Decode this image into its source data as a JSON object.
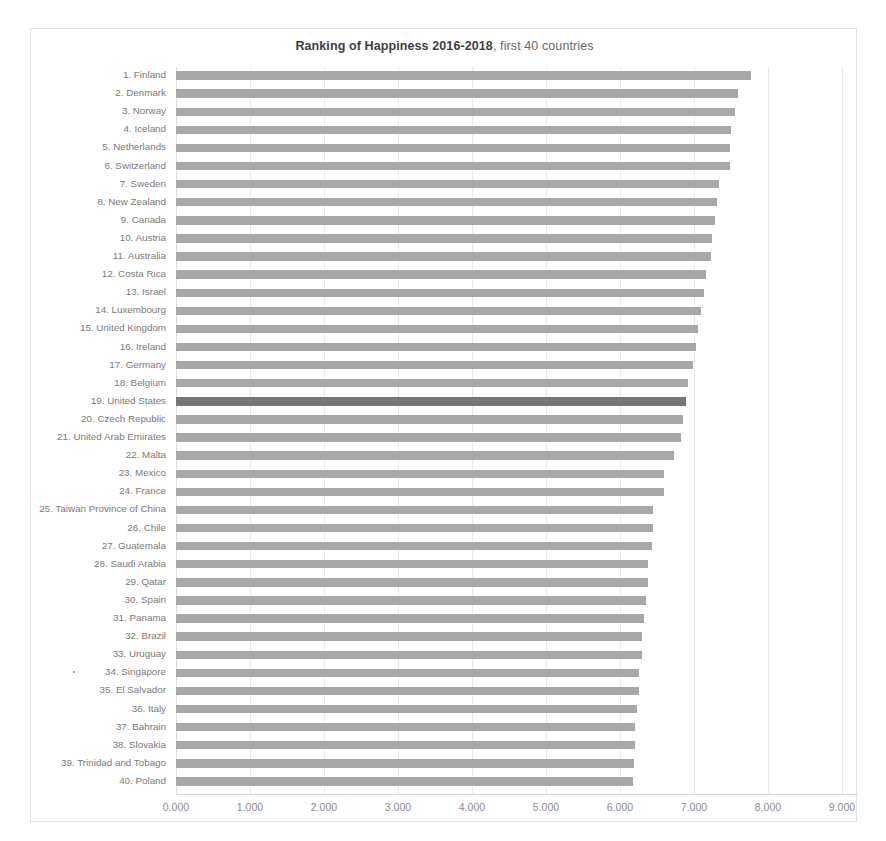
{
  "chart_data": {
    "type": "bar",
    "orientation": "horizontal",
    "title": "Ranking of Happiness 2016-2018, first 40 countries",
    "title_bold_part": "Ranking of Happiness 2016-2018",
    "title_normal_part": ", first 40 countries",
    "xlabel": "",
    "ylabel": "",
    "xlim": [
      0,
      9
    ],
    "xticks": [
      "0.000",
      "1.000",
      "2.000",
      "3.000",
      "4.000",
      "5.000",
      "6.000",
      "7.000",
      "8.000",
      "9.000"
    ],
    "xtick_values": [
      0,
      1,
      2,
      3,
      4,
      5,
      6,
      7,
      8,
      9
    ],
    "grid": "vertical",
    "legend": "none",
    "bar_color": "#a8a8a8",
    "highlight_color": "#767676",
    "highlight_category": "19. United States",
    "categories": [
      "1. Finland",
      "2. Denmark",
      "3. Norway",
      "4. Iceland",
      "5. Netherlands",
      "6. Switzerland",
      "7. Sweden",
      "8. New Zealand",
      "9. Canada",
      "10. Austria",
      "11. Australia",
      "12. Costa Rica",
      "13. Israel",
      "14. Luxembourg",
      "15. United Kingdom",
      "16. Ireland",
      "17. Germany",
      "18. Belgium",
      "19. United States",
      "20. Czech Republic",
      "21. United Arab Emirates",
      "22. Malta",
      "23. Mexico",
      "24. France",
      "25. Taiwan Province of China",
      "26. Chile",
      "27. Guatemala",
      "28. Saudi Arabia",
      "29. Qatar",
      "30. Spain",
      "31. Panama",
      "32. Brazil",
      "33. Uruguay",
      "34. Singapore",
      "35. El Salvador",
      "36. Italy",
      "37. Bahrain",
      "38. Slovakia",
      "39. Trinidad and Tobago",
      "40. Poland"
    ],
    "values": [
      7.769,
      7.6,
      7.554,
      7.494,
      7.488,
      7.48,
      7.343,
      7.307,
      7.278,
      7.246,
      7.228,
      7.167,
      7.139,
      7.09,
      7.054,
      7.021,
      6.985,
      6.923,
      6.892,
      6.852,
      6.825,
      6.726,
      6.595,
      6.592,
      6.446,
      6.444,
      6.436,
      6.375,
      6.374,
      6.354,
      6.321,
      6.3,
      6.293,
      6.262,
      6.253,
      6.223,
      6.199,
      6.198,
      6.192,
      6.182
    ]
  }
}
